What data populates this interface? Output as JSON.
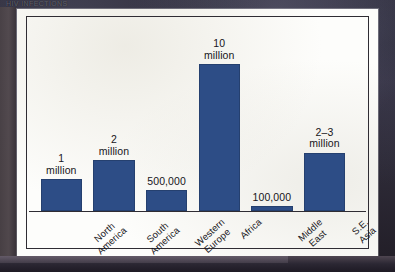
{
  "page": {
    "caption": "HIV INFECTIONS",
    "background_color": "#2a2734",
    "card_color": "#fdfdfb"
  },
  "chart_data": {
    "type": "bar",
    "title": "",
    "xlabel": "",
    "ylabel": "",
    "grid": false,
    "legend": "none",
    "bar_color": "#2d4d86",
    "ylim": [
      0,
      11
    ],
    "categories": [
      "North\nAmerica",
      "South\nAmerica",
      "Western\nEurope",
      "Africa",
      "Middle\nEast",
      "S.E. Asia"
    ],
    "value_labels": [
      "1\nmillion",
      "2\nmillion",
      "500,000",
      "10\nmillion",
      "100,000",
      "2–3\nmillion"
    ],
    "values": [
      1000000,
      2000000,
      500000,
      10000000,
      100000,
      2500000
    ],
    "values_millions": [
      1,
      2,
      0.5,
      10,
      0.1,
      2.5
    ],
    "units": "people infected"
  },
  "bars": [
    {
      "left_pct": 0.5,
      "width_pct": 13.0,
      "height_pct": 17.0,
      "value_label": "1\nmillion",
      "category": "North\nAmerica",
      "label_left_pct": 12.5
    },
    {
      "left_pct": 17.0,
      "width_pct": 13.0,
      "height_pct": 27.0,
      "value_label": "2\nmillion",
      "category": "South\nAmerica",
      "label_left_pct": 29.0
    },
    {
      "left_pct": 33.5,
      "width_pct": 13.0,
      "height_pct": 11.0,
      "value_label": "500,000",
      "category": "Western\nEurope",
      "label_left_pct": 45.5
    },
    {
      "left_pct": 50.0,
      "width_pct": 13.0,
      "height_pct": 78.0,
      "value_label": "10\nmillion",
      "category": "Africa",
      "label_left_pct": 60.5
    },
    {
      "left_pct": 66.5,
      "width_pct": 13.0,
      "height_pct": 2.5,
      "value_label": "100,000",
      "category": "Middle\nEast",
      "label_left_pct": 78.5
    },
    {
      "left_pct": 83.0,
      "width_pct": 13.0,
      "height_pct": 31.0,
      "value_label": "2–3\nmillion",
      "category": "S.E. Asia",
      "label_left_pct": 96.0
    }
  ]
}
